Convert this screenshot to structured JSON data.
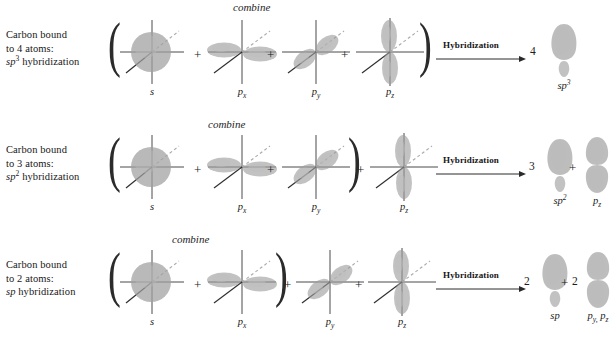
{
  "figure": {
    "combine_label": "combine",
    "hybridization_label": "Hybridization",
    "plus": "+",
    "comma": ","
  },
  "colors": {
    "orbital_fill": "#9a9a9a",
    "orbital_fill_light": "#b5b5b5",
    "axis": "#4a4a4a",
    "axis_dashed": "#9b9b9b",
    "text": "#1a1a1a",
    "background": "#ffffff"
  },
  "rows": [
    {
      "id": "sp3",
      "caption": {
        "line1": "Carbon bound",
        "line2": "to 4 atoms:",
        "line3_base": "sp",
        "line3_sup": "3",
        "line3_rest": " hybridization"
      },
      "combine": "combine",
      "inputs": [
        {
          "name": "s",
          "label_base": "s",
          "label_sub": "",
          "type": "sphere"
        },
        {
          "name": "px",
          "label_base": "p",
          "label_sub": "x",
          "type": "p-horizontal"
        },
        {
          "name": "py",
          "label_base": "p",
          "label_sub": "y",
          "type": "p-diagonal"
        },
        {
          "name": "pz",
          "label_base": "p",
          "label_sub": "z",
          "type": "p-vertical"
        }
      ],
      "paren_close_after": "pz",
      "arrow_label": "Hybridization",
      "outputs": [
        {
          "count": "4",
          "label_base": "sp",
          "label_sup": "3",
          "label_sub": "",
          "type": "hybrid"
        }
      ]
    },
    {
      "id": "sp2",
      "caption": {
        "line1": "Carbon bound",
        "line2": "to 3 atoms:",
        "line3_base": "sp",
        "line3_sup": "2",
        "line3_rest": " hybridization"
      },
      "combine": "combine",
      "inputs": [
        {
          "name": "s",
          "label_base": "s",
          "label_sub": "",
          "type": "sphere"
        },
        {
          "name": "px",
          "label_base": "p",
          "label_sub": "x",
          "type": "p-horizontal"
        },
        {
          "name": "py",
          "label_base": "p",
          "label_sub": "y",
          "type": "p-diagonal"
        },
        {
          "name": "pz",
          "label_base": "p",
          "label_sub": "z",
          "type": "p-vertical"
        }
      ],
      "paren_close_after": "py",
      "arrow_label": "Hybridization",
      "outputs": [
        {
          "count": "3",
          "label_base": "sp",
          "label_sup": "2",
          "label_sub": "",
          "type": "hybrid"
        },
        {
          "count": "",
          "label_base": "p",
          "label_sup": "",
          "label_sub": "z",
          "type": "p-vertical-solo"
        }
      ]
    },
    {
      "id": "sp",
      "caption": {
        "line1": "Carbon bound",
        "line2": "to 2 atoms:",
        "line3_base": "sp",
        "line3_sup": "",
        "line3_rest": " hybridization"
      },
      "combine": "combine",
      "inputs": [
        {
          "name": "s",
          "label_base": "s",
          "label_sub": "",
          "type": "sphere"
        },
        {
          "name": "px",
          "label_base": "p",
          "label_sub": "x",
          "type": "p-horizontal"
        },
        {
          "name": "py",
          "label_base": "p",
          "label_sub": "y",
          "type": "p-diagonal"
        },
        {
          "name": "pz",
          "label_base": "p",
          "label_sub": "z",
          "type": "p-vertical"
        }
      ],
      "paren_close_after": "px",
      "arrow_label": "Hybridization",
      "outputs": [
        {
          "count": "2",
          "label_base": "sp",
          "label_sup": "",
          "label_sub": "",
          "type": "hybrid"
        },
        {
          "count": "2",
          "label_base": "p",
          "label_sup": "",
          "label_sub": "y",
          "label_base2": "p",
          "label_sub2": "z",
          "type": "p-vertical-solo"
        }
      ]
    }
  ]
}
